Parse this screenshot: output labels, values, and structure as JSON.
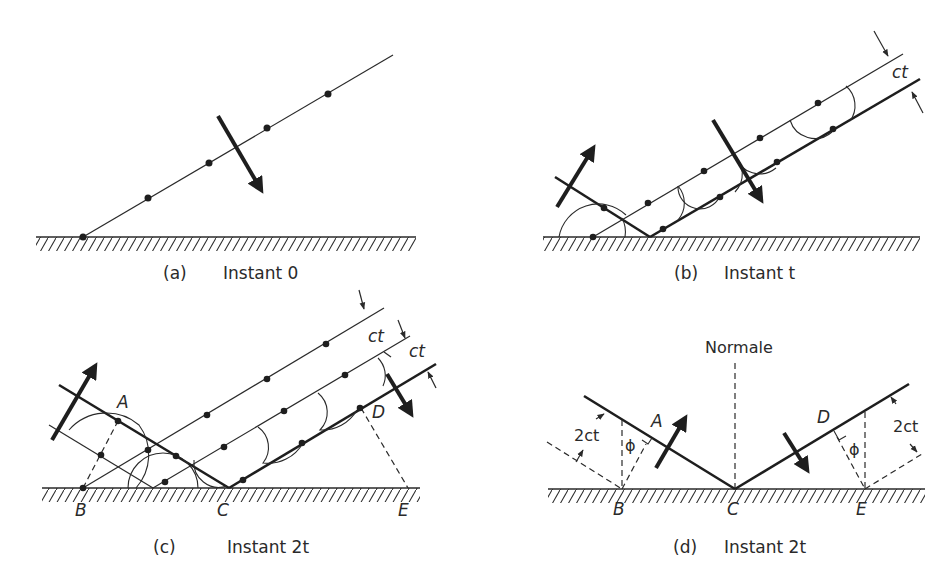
{
  "figure": {
    "panels": [
      {
        "id": "a",
        "caption_letter": "(a)",
        "caption_text": "Instant 0"
      },
      {
        "id": "b",
        "caption_letter": "(b)",
        "caption_text": "Instant t",
        "dimension_label": "ct"
      },
      {
        "id": "c",
        "caption_letter": "(c)",
        "caption_text": "Instant 2t",
        "dimension_labels": [
          "ct",
          "ct"
        ],
        "points": {
          "A": "A",
          "B": "B",
          "C": "C",
          "D": "D",
          "E": "E"
        }
      },
      {
        "id": "d",
        "caption_letter": "(d)",
        "caption_text": "Instant 2t",
        "normal_label": "Normale",
        "dimension_labels": [
          "2ct",
          "2ct"
        ],
        "angle_labels": [
          "ϕ",
          "ϕ"
        ],
        "points": {
          "A": "A",
          "B": "B",
          "C": "C",
          "D": "D",
          "E": "E"
        }
      }
    ]
  },
  "colors": {
    "ink": "#1e1e1e",
    "background": "#ffffff"
  }
}
